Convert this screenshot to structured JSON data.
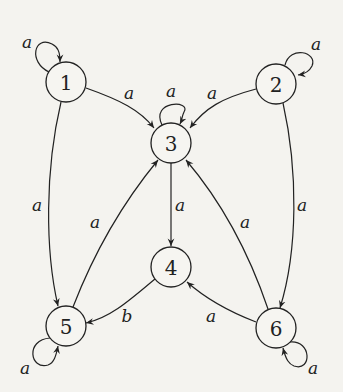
{
  "diagram": {
    "type": "automaton",
    "nodes": [
      {
        "id": "1",
        "label": "1",
        "x": 66,
        "y": 82
      },
      {
        "id": "2",
        "label": "2",
        "x": 276,
        "y": 84
      },
      {
        "id": "3",
        "label": "3",
        "x": 171,
        "y": 143
      },
      {
        "id": "4",
        "label": "4",
        "x": 171,
        "y": 267
      },
      {
        "id": "5",
        "label": "5",
        "x": 66,
        "y": 326
      },
      {
        "id": "6",
        "label": "6",
        "x": 276,
        "y": 328
      }
    ],
    "edges": [
      {
        "from": "1",
        "to": "1",
        "label": "a"
      },
      {
        "from": "2",
        "to": "2",
        "label": "a"
      },
      {
        "from": "3",
        "to": "3",
        "label": "a"
      },
      {
        "from": "5",
        "to": "5",
        "label": "a"
      },
      {
        "from": "6",
        "to": "6",
        "label": "a"
      },
      {
        "from": "1",
        "to": "3",
        "label": "a"
      },
      {
        "from": "2",
        "to": "3",
        "label": "a"
      },
      {
        "from": "1",
        "to": "5",
        "label": "a"
      },
      {
        "from": "2",
        "to": "6",
        "label": "a"
      },
      {
        "from": "3",
        "to": "4",
        "label": "a"
      },
      {
        "from": "5",
        "to": "3",
        "label": "a"
      },
      {
        "from": "6",
        "to": "3",
        "label": "a"
      },
      {
        "from": "4",
        "to": "5",
        "label": "b"
      },
      {
        "from": "6",
        "to": "4",
        "label": "a"
      }
    ]
  }
}
